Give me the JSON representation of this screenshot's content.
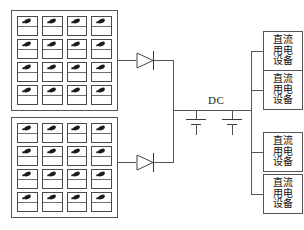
{
  "diagram": {
    "dc_bus_label": "DC",
    "colors": {
      "line": "#555555",
      "cell_mark": "#1c1c1c",
      "background": "#ffffff",
      "text": "#111111"
    }
  },
  "pv_arrays": [
    {
      "name": "upper-solar-array",
      "rows": 4,
      "cols": 4,
      "cell_count": 16
    },
    {
      "name": "lower-solar-array",
      "rows": 4,
      "cols": 4,
      "cell_count": 16
    }
  ],
  "diodes": [
    {
      "name": "upper-blocking-diode",
      "symbol": "diode"
    },
    {
      "name": "lower-blocking-diode",
      "symbol": "diode"
    }
  ],
  "capacitors": [
    {
      "name": "dc-bus-capacitor-1",
      "symbol": "capacitor"
    },
    {
      "name": "dc-bus-capacitor-2",
      "symbol": "capacitor"
    }
  ],
  "loads": [
    {
      "text": "直流用电设备",
      "chars_col_right": [
        "流",
        "电",
        "备"
      ],
      "chars_col_left": [
        "直",
        "用",
        "设"
      ]
    },
    {
      "text": "直流用电设备",
      "chars_col_right": [
        "流",
        "电",
        "备"
      ],
      "chars_col_left": [
        "直",
        "用",
        "设"
      ]
    },
    {
      "text": "直流用电设备",
      "chars_col_right": [
        "流",
        "电",
        "备"
      ],
      "chars_col_left": [
        "直",
        "用",
        "设"
      ]
    },
    {
      "text": "直流用电设备",
      "chars_col_right": [
        "流",
        "电",
        "备"
      ],
      "chars_col_left": [
        "直",
        "用",
        "设"
      ]
    }
  ]
}
